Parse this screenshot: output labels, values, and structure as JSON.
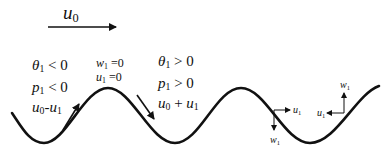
{
  "diagram": {
    "type": "internal-wave-schematic",
    "mean_flow": {
      "symbol": "u",
      "subscript": "0",
      "direction": "right"
    },
    "left_phase": {
      "theta": {
        "symbol": "θ",
        "sub": "1",
        "rel": " < 0"
      },
      "pressure": {
        "symbol": "p",
        "sub": "1",
        "rel": " < 0"
      },
      "velocity": {
        "a": "u",
        "asub": "0",
        "op": "-",
        "b": "u",
        "bsub": "1"
      },
      "arrow": "up-right along slope"
    },
    "crest": {
      "w": {
        "symbol": "w",
        "sub": "1",
        "rel": " =0"
      },
      "u": {
        "symbol": "u",
        "sub": "1",
        "rel": " =0"
      }
    },
    "right_phase": {
      "theta": {
        "symbol": "θ",
        "sub": "1",
        "rel": " > 0"
      },
      "pressure": {
        "symbol": "p",
        "sub": "1",
        "rel": " > 0"
      },
      "velocity": {
        "a": "u",
        "asub": "0",
        "op": " + ",
        "b": "u",
        "bsub": "1"
      },
      "arrow": "down-right along slope"
    },
    "descending_node": {
      "u": {
        "symbol": "u",
        "sub": "1",
        "direction": "right"
      },
      "w": {
        "symbol": "w",
        "sub": "1",
        "direction": "down"
      }
    },
    "ascending_node": {
      "u": {
        "symbol": "u",
        "sub": "1",
        "direction": "left"
      },
      "w": {
        "symbol": "w",
        "sub": "1",
        "direction": "up"
      }
    },
    "colors": {
      "line": "#111111",
      "background": "#ffffff"
    }
  }
}
